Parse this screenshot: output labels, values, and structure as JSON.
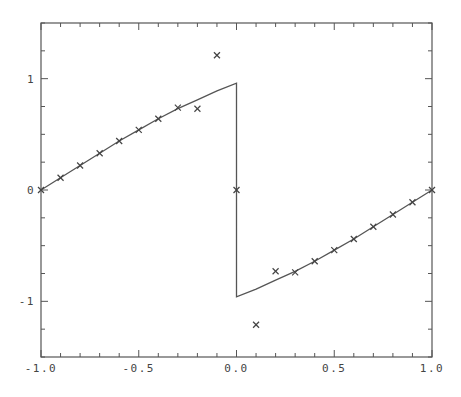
{
  "chart_data": {
    "type": "line",
    "title": "",
    "xlabel": "",
    "ylabel": "",
    "xlim": [
      -1.0,
      1.0
    ],
    "ylim": [
      -1.5,
      1.5
    ],
    "grid": false,
    "legend": null,
    "x_ticks": [
      -1.0,
      -0.5,
      0.0,
      0.5,
      1.0
    ],
    "x_tick_labels": [
      "-1.0",
      "-0.5",
      "0.0",
      "0.5",
      "1.0"
    ],
    "x_minor_step": 0.1,
    "y_ticks": [
      -1,
      0,
      1
    ],
    "y_tick_labels": [
      "-1",
      "0",
      "1"
    ],
    "y_minor_step": 0.25,
    "series": [
      {
        "name": "exact solution (curve)",
        "style": "line",
        "x": [
          -1.0,
          -0.9,
          -0.8,
          -0.7,
          -0.6,
          -0.5,
          -0.4,
          -0.3,
          -0.2,
          -0.1,
          0.0,
          0.0,
          0.1,
          0.2,
          0.3,
          0.4,
          0.5,
          0.6,
          0.7,
          0.8,
          0.9,
          1.0
        ],
        "y": [
          0.0,
          0.11,
          0.22,
          0.33,
          0.44,
          0.54,
          0.64,
          0.73,
          0.81,
          0.89,
          0.96,
          -0.96,
          -0.89,
          -0.81,
          -0.73,
          -0.64,
          -0.54,
          -0.44,
          -0.33,
          -0.22,
          -0.11,
          0.0
        ]
      },
      {
        "name": "computed points (x markers)",
        "style": "markers",
        "marker": "x",
        "x": [
          -1.0,
          -0.9,
          -0.8,
          -0.7,
          -0.6,
          -0.5,
          -0.4,
          -0.3,
          -0.2,
          -0.1,
          0.0,
          0.1,
          0.2,
          0.3,
          0.4,
          0.5,
          0.6,
          0.7,
          0.8,
          0.9,
          1.0
        ],
        "y": [
          0.0,
          0.11,
          0.22,
          0.33,
          0.44,
          0.54,
          0.64,
          0.74,
          0.73,
          1.21,
          0.0,
          -1.21,
          -0.73,
          -0.74,
          -0.64,
          -0.54,
          -0.44,
          -0.33,
          -0.22,
          -0.11,
          0.0
        ]
      }
    ]
  },
  "colors": {
    "axis": "#555555",
    "curve": "#555555",
    "marker": "#444444",
    "background": "#ffffff"
  }
}
